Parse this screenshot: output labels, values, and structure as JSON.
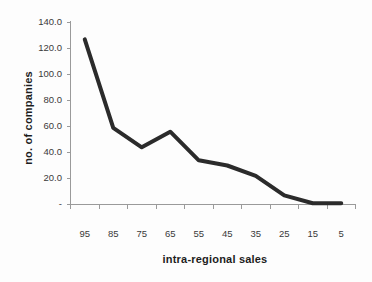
{
  "chart_data": {
    "type": "line",
    "title": "",
    "xlabel": "intra-regional sales",
    "ylabel": "no. of companies",
    "x": [
      95,
      85,
      75,
      65,
      55,
      45,
      35,
      25,
      15,
      10
    ],
    "values": [
      127,
      59,
      44,
      56,
      34,
      30,
      22,
      7,
      1,
      1
    ],
    "categories": [
      "95",
      "85",
      "75",
      "65",
      "55",
      "45",
      "35",
      "25",
      "15",
      "5"
    ],
    "xtick_labels": [
      "95",
      "85",
      "75",
      "65",
      "55",
      "45",
      "35",
      "25",
      "15",
      "5"
    ],
    "ytick_labels": [
      "140.0",
      "120.0",
      "100.0",
      "80.0",
      "60.0",
      "40.0",
      "20.0",
      "-"
    ],
    "ytick_values": [
      140,
      120,
      100,
      80,
      60,
      40,
      20,
      0
    ],
    "ylim": [
      0,
      140
    ],
    "xlim_reversed": true,
    "grid": false,
    "legend": false,
    "series": [
      {
        "name": "no. of companies",
        "values": [
          127,
          59,
          44,
          56,
          34,
          30,
          22,
          7,
          1,
          1
        ]
      }
    ],
    "line_color": "#2b2b2b",
    "axis_color": "#9a9a9a",
    "background_color": "#fdfdfd"
  }
}
